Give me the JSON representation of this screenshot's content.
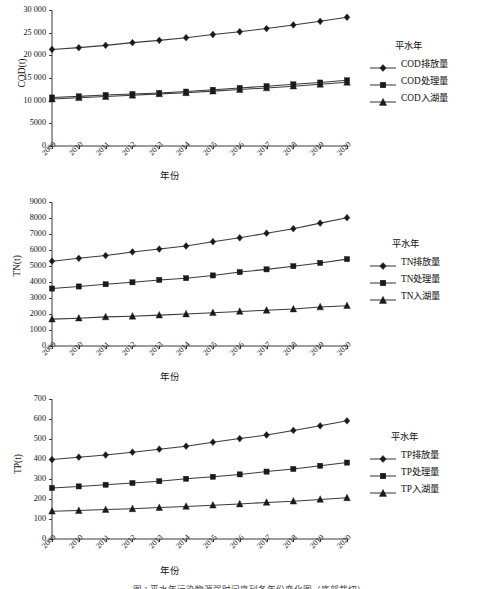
{
  "figure": {
    "caption": "图 1   平水年污染物源强时间序列各年份变化图（底部裁切）",
    "legend_title": "平水年",
    "xlabel": "年份",
    "years": [
      "2009",
      "2010",
      "2011",
      "2012",
      "2013",
      "2014",
      "2015",
      "2016",
      "2017",
      "2018",
      "2019",
      "2020"
    ],
    "colors": {
      "line": "#3a3a3a",
      "marker": "#1a1a1a",
      "axis": "#3a3a3a",
      "text": "#111111",
      "background": "#ffffff"
    },
    "markers": {
      "discharge": "diamond",
      "treated": "square",
      "into_lake": "triangle"
    }
  },
  "chart_data": [
    {
      "type": "line",
      "title": "",
      "ylabel": "COD(t)",
      "xlabel": "年份",
      "legend_title": "平水年",
      "legend_position": "right",
      "grid": false,
      "categories": [
        "2009",
        "2010",
        "2011",
        "2012",
        "2013",
        "2014",
        "2015",
        "2016",
        "2017",
        "2018",
        "2019",
        "2020"
      ],
      "ylim": [
        0,
        30000
      ],
      "yticks": [
        0,
        5000,
        10000,
        15000,
        20000,
        25000,
        30000
      ],
      "ytick_labels": [
        "0",
        "5000",
        "10 000",
        "15 000",
        "20 000",
        "25 000",
        "30 000"
      ],
      "series": [
        {
          "name": "COD排放量",
          "marker": "diamond",
          "values": [
            21300,
            21700,
            22200,
            22800,
            23300,
            23900,
            24600,
            25200,
            25900,
            26700,
            27500,
            28400
          ]
        },
        {
          "name": "COD处理量",
          "marker": "square",
          "values": [
            10700,
            10950,
            11250,
            11450,
            11700,
            12000,
            12400,
            12800,
            13200,
            13600,
            14000,
            14500
          ]
        },
        {
          "name": "COD入湖量",
          "marker": "triangle",
          "values": [
            10350,
            10650,
            10900,
            11200,
            11500,
            11750,
            12100,
            12450,
            12800,
            13200,
            13600,
            14050
          ]
        }
      ]
    },
    {
      "type": "line",
      "title": "",
      "ylabel": "TN(t)",
      "xlabel": "年份",
      "legend_title": "平水年",
      "legend_position": "right",
      "grid": false,
      "categories": [
        "2009",
        "2010",
        "2011",
        "2012",
        "2013",
        "2014",
        "2015",
        "2016",
        "2017",
        "2018",
        "2019",
        "2020"
      ],
      "ylim": [
        0,
        9000
      ],
      "yticks": [
        0,
        1000,
        2000,
        3000,
        4000,
        5000,
        6000,
        7000,
        8000,
        9000
      ],
      "ytick_labels": [
        "0",
        "1000",
        "2000",
        "3000",
        "4000",
        "5000",
        "6000",
        "7000",
        "8000",
        "9000"
      ],
      "series": [
        {
          "name": "TN排放量",
          "marker": "diamond",
          "values": [
            5300,
            5480,
            5650,
            5880,
            6060,
            6250,
            6520,
            6760,
            7050,
            7330,
            7680,
            8020
          ]
        },
        {
          "name": "TN处理量",
          "marker": "square",
          "values": [
            3590,
            3720,
            3860,
            3980,
            4130,
            4240,
            4410,
            4620,
            4790,
            4990,
            5190,
            5430
          ]
        },
        {
          "name": "TN入湖量",
          "marker": "triangle",
          "values": [
            1680,
            1740,
            1820,
            1860,
            1930,
            2000,
            2080,
            2160,
            2230,
            2310,
            2440,
            2520
          ]
        }
      ]
    },
    {
      "type": "line",
      "title": "",
      "ylabel": "TP(t)",
      "xlabel": "年份",
      "legend_title": "平水年",
      "legend_position": "right",
      "grid": false,
      "categories": [
        "2009",
        "2010",
        "2011",
        "2012",
        "2013",
        "2014",
        "2015",
        "2016",
        "2017",
        "2018",
        "2019",
        "2020"
      ],
      "ylim": [
        0,
        700
      ],
      "yticks": [
        0,
        100,
        200,
        300,
        400,
        500,
        600,
        700
      ],
      "ytick_labels": [
        "0",
        "100",
        "200",
        "300",
        "400",
        "500",
        "600",
        "700"
      ],
      "series": [
        {
          "name": "TP排放量",
          "marker": "diamond",
          "values": [
            397,
            409,
            420,
            434,
            449,
            464,
            484,
            502,
            520,
            543,
            566,
            591
          ]
        },
        {
          "name": "TP处理量",
          "marker": "square",
          "values": [
            255,
            263,
            271,
            280,
            289,
            301,
            311,
            323,
            337,
            350,
            366,
            382
          ]
        },
        {
          "name": "TP入湖量",
          "marker": "triangle",
          "values": [
            139,
            142,
            147,
            151,
            157,
            163,
            169,
            175,
            183,
            189,
            198,
            206
          ]
        }
      ]
    }
  ]
}
